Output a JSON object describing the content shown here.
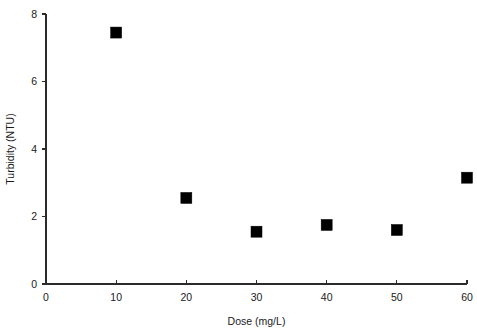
{
  "chart_data": {
    "type": "scatter",
    "title": "",
    "xlabel": "Dose (mg/L)",
    "ylabel": "Turbidity (NTU)",
    "xlim": [
      0,
      60
    ],
    "ylim": [
      0,
      8
    ],
    "xticks": [
      0,
      10,
      20,
      30,
      40,
      50,
      60
    ],
    "yticks": [
      0,
      2,
      4,
      6,
      8
    ],
    "xtick_labels": [
      "0",
      "10",
      "20",
      "30",
      "40",
      "50",
      "60"
    ],
    "ytick_labels": [
      "0",
      "2",
      "4",
      "6",
      "8"
    ],
    "grid": false,
    "legend": false,
    "marker": "filled-square",
    "marker_color": "#000000",
    "x": [
      10,
      20,
      30,
      40,
      50,
      60
    ],
    "values": [
      7.45,
      2.55,
      1.55,
      1.75,
      1.6,
      3.15
    ],
    "series": [
      {
        "name": "Turbidity",
        "points": [
          {
            "x": 10,
            "y": 7.45
          },
          {
            "x": 20,
            "y": 2.55
          },
          {
            "x": 30,
            "y": 1.55
          },
          {
            "x": 40,
            "y": 1.75
          },
          {
            "x": 50,
            "y": 1.6
          },
          {
            "x": 60,
            "y": 3.15
          }
        ]
      }
    ]
  },
  "plot_geometry": {
    "left": 46,
    "right": 467,
    "top": 14,
    "bottom": 284,
    "marker_size": 11
  }
}
